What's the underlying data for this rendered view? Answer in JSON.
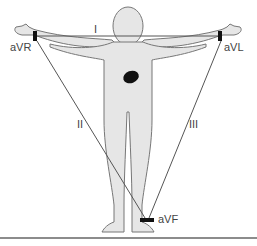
{
  "diagram": {
    "labels": {
      "lead_I": "I",
      "lead_II": "II",
      "lead_III": "III",
      "aVR": "aVR",
      "aVL": "aVL",
      "aVF": "aVF"
    },
    "colors": {
      "body_fill": "#e6e6e6",
      "body_outline": "#777777",
      "lead_lines": "#555555",
      "electrodes": "#111111",
      "heart": "#111111",
      "ground": "#666666",
      "text": "#444444"
    }
  }
}
